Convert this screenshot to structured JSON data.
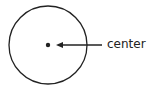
{
  "diagram": {
    "title": "",
    "shapes": [
      {
        "type": "circle",
        "name": "circle",
        "cx": 48,
        "cy": 45,
        "r": 39
      },
      {
        "type": "point",
        "name": "center-point",
        "cx": 48,
        "cy": 45
      }
    ],
    "annotations": [
      {
        "text": "center",
        "points_to": "center-point"
      }
    ],
    "label": "center",
    "colors": {
      "stroke": "#222222",
      "background": "#ffffff"
    }
  }
}
